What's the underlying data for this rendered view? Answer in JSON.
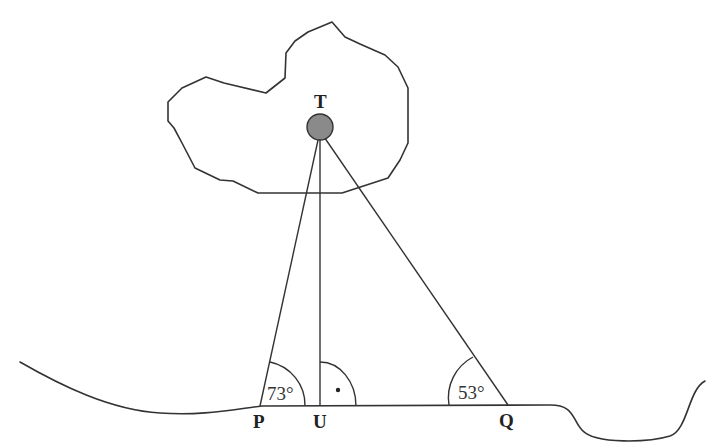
{
  "diagram": {
    "type": "geometry-survey",
    "points": {
      "T": {
        "label": "T",
        "description": "object on island (filled circle)"
      },
      "P": {
        "label": "P"
      },
      "U": {
        "label": "U"
      },
      "Q": {
        "label": "Q"
      }
    },
    "angles": [
      {
        "vertex": "P",
        "label": "73°"
      },
      {
        "vertex": "U",
        "label": "right-angle",
        "marker": "dot"
      },
      {
        "vertex": "Q",
        "label": "53°"
      }
    ],
    "segments": [
      "TP",
      "TU",
      "TQ",
      "PQ"
    ],
    "shapes": [
      "island-outline",
      "coastline"
    ],
    "colors": {
      "stroke": "#333333",
      "point_fill": "#8a8a8a",
      "background": "#ffffff"
    }
  }
}
